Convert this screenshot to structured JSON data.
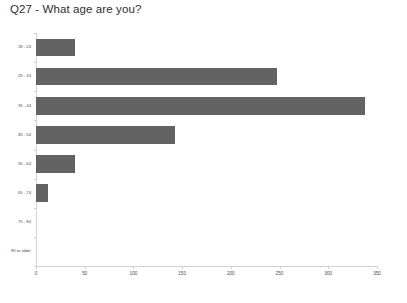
{
  "chart_data": {
    "type": "bar",
    "orientation": "horizontal",
    "title": "Q27 - What age are you?",
    "xlabel": "",
    "ylabel": "",
    "categories": [
      "18 - 24",
      "25 - 34",
      "35 - 44",
      "45 - 54",
      "55 - 64",
      "65 - 74",
      "75 - 84",
      "85 or older"
    ],
    "values": [
      40,
      247,
      338,
      143,
      40,
      12,
      0,
      0
    ],
    "xlim": [
      0,
      350
    ],
    "xticks": [
      0,
      50,
      100,
      150,
      200,
      250,
      300,
      350
    ],
    "xticklabels": [
      "0",
      "50",
      "100",
      "150",
      "200",
      "250",
      "300",
      "350"
    ],
    "grid": false,
    "legend": null,
    "bar_color": "#636363"
  },
  "colors": {
    "bar": "#636363",
    "axis": "#d2d2d2",
    "text": "#4a4a4a",
    "title": "#2e2e2e",
    "background": "#ffffff"
  }
}
